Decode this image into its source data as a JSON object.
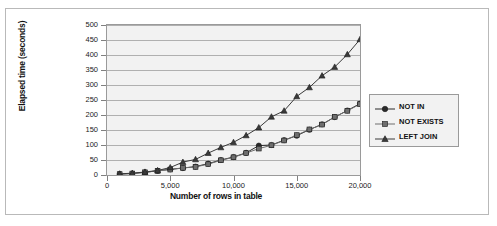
{
  "chart_data": {
    "type": "line",
    "title": "",
    "xlabel": "Number of rows in table",
    "ylabel": "Elapsed time (seconds)",
    "xlim": [
      0,
      20000
    ],
    "ylim": [
      0,
      500
    ],
    "grid": true,
    "legend_position": "right",
    "x_ticks": [
      "0",
      "5,000",
      "10,000",
      "15,000",
      "20,000"
    ],
    "x_tick_values": [
      0,
      5000,
      10000,
      15000,
      20000
    ],
    "y_ticks": [
      "0",
      "50",
      "100",
      "150",
      "200",
      "250",
      "300",
      "350",
      "400",
      "450",
      "500"
    ],
    "y_tick_values": [
      0,
      50,
      100,
      150,
      200,
      250,
      300,
      350,
      400,
      450,
      500
    ],
    "x": [
      1000,
      2000,
      3000,
      4000,
      5000,
      6000,
      7000,
      8000,
      9000,
      10000,
      11000,
      12000,
      13000,
      14000,
      15000,
      16000,
      17000,
      18000,
      19000,
      20000
    ],
    "series": [
      {
        "name": "NOT IN",
        "marker": "circle",
        "color": "#2b2b2b",
        "values": [
          3,
          5,
          9,
          14,
          19,
          23,
          28,
          38,
          50,
          60,
          74,
          98,
          100,
          116,
          131,
          151,
          169,
          193,
          215,
          238
        ]
      },
      {
        "name": "NOT EXISTS",
        "marker": "square",
        "color": "#6e6e6e",
        "values": [
          3,
          5,
          9,
          14,
          18,
          24,
          27,
          36,
          49,
          59,
          73,
          88,
          99,
          115,
          133,
          152,
          168,
          194,
          214,
          236
        ]
      },
      {
        "name": "LEFT JOIN",
        "marker": "triangle",
        "color": "#3a3a3a",
        "values": [
          4,
          6,
          10,
          15,
          25,
          43,
          52,
          73,
          92,
          109,
          132,
          158,
          194,
          214,
          262,
          292,
          331,
          360,
          402,
          452
        ]
      }
    ]
  },
  "legend": {
    "items": [
      {
        "label": "NOT IN"
      },
      {
        "label": "NOT EXISTS"
      },
      {
        "label": "LEFT JOIN"
      }
    ]
  }
}
